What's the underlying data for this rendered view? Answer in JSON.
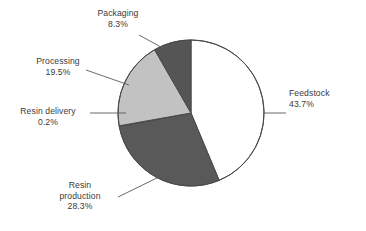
{
  "chart_data": {
    "type": "pie",
    "title": "",
    "subtitle": "",
    "xlabel": "",
    "ylabel": "",
    "grid": false,
    "legend": "none",
    "label_style": "outside-with-leader-lines",
    "units": "percent",
    "total": 100.0,
    "start_angle_deg": 0,
    "direction": "clockwise",
    "categories": [
      "Feedstock",
      "Resin production",
      "Resin delivery",
      "Processing",
      "Packaging"
    ],
    "values": [
      43.7,
      28.3,
      0.2,
      19.5,
      8.3
    ],
    "slices": [
      {
        "label": "Feedstock",
        "value": 43.7,
        "value_text": "43.7%",
        "color": "#ffffff",
        "start_angle_deg": 0.0,
        "end_angle_deg": 157.3,
        "label_lines": [
          "Feedstock",
          "43.7%"
        ],
        "label_align": "left"
      },
      {
        "label": "Resin production",
        "value": 28.3,
        "value_text": "28.3%",
        "color": "#595959",
        "start_angle_deg": 157.3,
        "end_angle_deg": 259.2,
        "label_lines": [
          "Resin",
          "production",
          "28.3%"
        ],
        "label_align": "center"
      },
      {
        "label": "Resin delivery",
        "value": 0.2,
        "value_text": "0.2%",
        "color": "#808080",
        "start_angle_deg": 259.2,
        "end_angle_deg": 259.9,
        "label_lines": [
          "Resin delivery",
          "0.2%"
        ],
        "label_align": "center"
      },
      {
        "label": "Processing",
        "value": 19.5,
        "value_text": "19.5%",
        "color": "#c2c2c2",
        "start_angle_deg": 259.9,
        "end_angle_deg": 330.1,
        "label_lines": [
          "Processing",
          "19.5%"
        ],
        "label_align": "center"
      },
      {
        "label": "Packaging",
        "value": 8.3,
        "value_text": "8.3%",
        "color": "#555555",
        "start_angle_deg": 330.1,
        "end_angle_deg": 360.0,
        "label_lines": [
          "Packaging",
          "8.3%"
        ],
        "label_align": "center"
      }
    ]
  },
  "labels": {
    "feedstock": {
      "name": "Feedstock",
      "pct": "43.7%"
    },
    "resin_production": {
      "name_line1": "Resin",
      "name_line2": "production",
      "pct": "28.3%"
    },
    "resin_delivery": {
      "name": "Resin delivery",
      "pct": "0.2%"
    },
    "processing": {
      "name": "Processing",
      "pct": "19.5%"
    },
    "packaging": {
      "name": "Packaging",
      "pct": "8.3%"
    }
  },
  "colors": {
    "background": "#ffffff",
    "outline": "#4a4a4a",
    "leader_line": "#5a5a5a",
    "text": "#3a3a3a",
    "slice_feedstock": "#ffffff",
    "slice_resin_production": "#595959",
    "slice_resin_delivery": "#808080",
    "slice_processing": "#c2c2c2",
    "slice_packaging": "#555555"
  }
}
